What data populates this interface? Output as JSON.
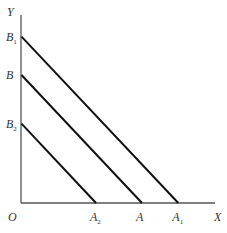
{
  "diagram": {
    "type": "budget-lines",
    "axes": {
      "x_label": "X",
      "y_label": "Y",
      "origin_label": "O"
    },
    "lines": [
      {
        "name": "B1-A1",
        "y_intercept": {
          "label": "B",
          "sub": "1"
        },
        "x_intercept": {
          "label": "A",
          "sub": "1"
        },
        "relative_intercept": 1.3
      },
      {
        "name": "B-A",
        "y_intercept": {
          "label": "B",
          "sub": ""
        },
        "x_intercept": {
          "label": "A",
          "sub": ""
        },
        "relative_intercept": 1.0
      },
      {
        "name": "B2-A2",
        "y_intercept": {
          "label": "B",
          "sub": "2"
        },
        "x_intercept": {
          "label": "A",
          "sub": "2"
        },
        "relative_intercept": 0.62
      }
    ],
    "colors": {
      "line": "#111111",
      "axis": "#555555",
      "text": "#333333"
    }
  }
}
